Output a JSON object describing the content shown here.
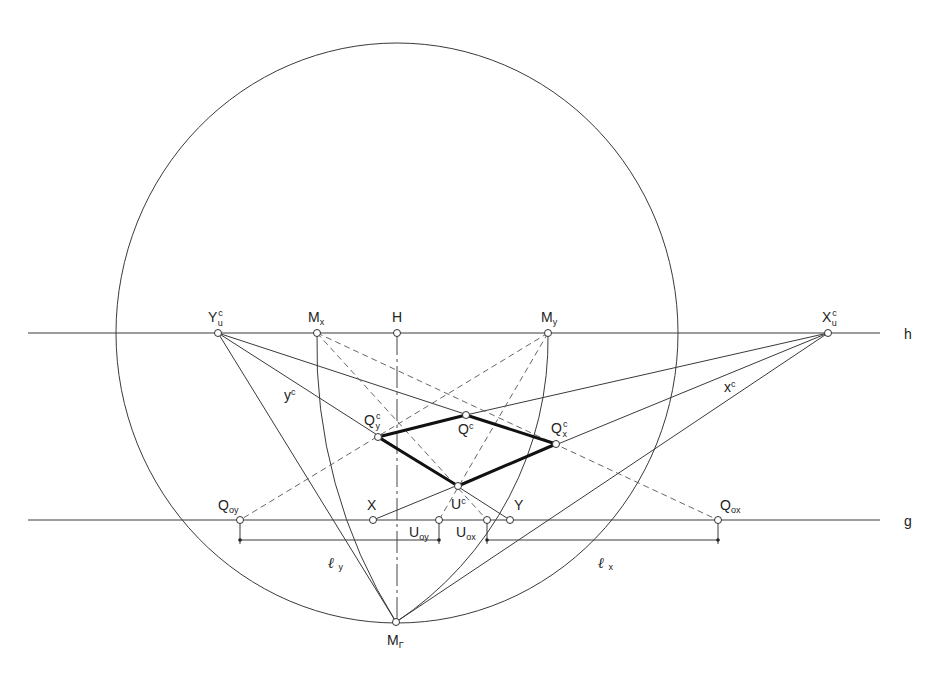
{
  "diagram": {
    "lines": {
      "horizon": {
        "label": "h",
        "y": 333,
        "x1": 28,
        "x2": 880
      },
      "ground": {
        "label": "g",
        "y": 520,
        "x1": 28,
        "x2": 880
      }
    },
    "circle": {
      "cx": 397,
      "cy": 333,
      "rx": 281,
      "ry": 290
    },
    "points": {
      "Yu": {
        "x": 218,
        "y": 333,
        "label": "Y",
        "sup": "c",
        "sub": "u"
      },
      "Mx": {
        "x": 317,
        "y": 333,
        "label": "M",
        "sub": "x"
      },
      "H": {
        "x": 397,
        "y": 333,
        "label": "H"
      },
      "My": {
        "x": 548,
        "y": 333,
        "label": "M",
        "sub": "y"
      },
      "Xu": {
        "x": 828,
        "y": 333,
        "label": "X",
        "sup": "c",
        "sub": "u"
      },
      "Qy": {
        "x": 378,
        "y": 437,
        "label": "Q",
        "sup": "c",
        "sub": "y"
      },
      "Q": {
        "x": 466,
        "y": 415,
        "label": "Q",
        "sup": "c"
      },
      "Qx": {
        "x": 556,
        "y": 444,
        "label": "Q",
        "sup": "c",
        "sub": "x"
      },
      "U": {
        "x": 458,
        "y": 486,
        "label": "U",
        "sup": "c"
      },
      "Qoy": {
        "x": 240,
        "y": 520,
        "label": "Q",
        "sub": "oy"
      },
      "X": {
        "x": 373,
        "y": 520,
        "label": "X"
      },
      "Uoy": {
        "x": 439,
        "y": 520,
        "label": "U",
        "sub": "oy"
      },
      "Uox": {
        "x": 487,
        "y": 520,
        "label": "U",
        "sub": "ox"
      },
      "Y": {
        "x": 510,
        "y": 520,
        "label": "Y"
      },
      "Qox": {
        "x": 718,
        "y": 520,
        "label": "Q",
        "sub": "ox"
      },
      "MG": {
        "x": 396,
        "y": 622,
        "label": "M",
        "sub": "Γ"
      }
    },
    "line_labels": {
      "yc": {
        "label": "y",
        "sup": "c"
      },
      "xc": {
        "label": "x",
        "sup": "c"
      }
    },
    "dimensions": {
      "ly": {
        "label": "ℓ",
        "sub": "y",
        "x1": 240,
        "x2": 439,
        "y": 540
      },
      "lx": {
        "label": "ℓ",
        "sub": "x",
        "x1": 487,
        "x2": 718,
        "y": 540
      }
    },
    "colors": {
      "stroke": "#333333",
      "bold": "#111111",
      "background": "#ffffff"
    }
  }
}
